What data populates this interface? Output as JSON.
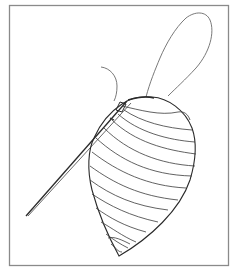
{
  "figure": {
    "colors": {
      "background": "#ffffff",
      "frame": "#8a8a8a",
      "line": "#2a2a2a",
      "thread": "#6a6a6a"
    },
    "frame": {
      "x": 9,
      "y": 5,
      "width": 220,
      "height": 261
    },
    "elements": [
      {
        "name": "pouch-outline",
        "type": "leaf-shape"
      },
      {
        "name": "needle",
        "type": "straight-instrument"
      },
      {
        "name": "thread-loop",
        "type": "free-thread"
      },
      {
        "name": "thread-tail",
        "type": "free-thread"
      },
      {
        "name": "stitch-lines",
        "count": 14
      }
    ]
  }
}
